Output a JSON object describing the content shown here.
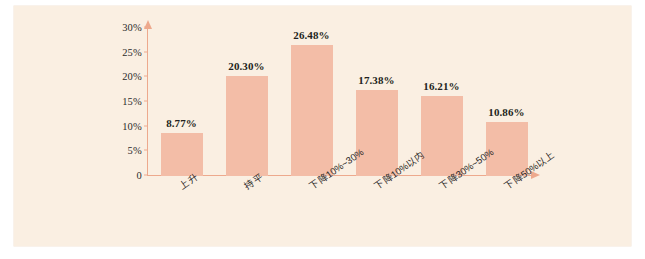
{
  "figure": {
    "background_color": "#faefe2",
    "bar_color": "#f3bda7",
    "axis_color": "#eda98d",
    "text_color": "#231f20"
  },
  "chart_data": {
    "type": "bar",
    "title": "",
    "xlabel": "",
    "ylabel": "",
    "ylim": [
      0,
      30
    ],
    "grid": false,
    "legend": "none",
    "categories": [
      "上升",
      "持平",
      "下降10%~30%",
      "下降10%以内",
      "下降30%~50%",
      "下降50%以上"
    ],
    "values": [
      8.77,
      20.3,
      26.48,
      17.38,
      16.21,
      10.86
    ],
    "data_labels": [
      "8.77%",
      "20.30%",
      "26.48%",
      "17.38%",
      "16.21%",
      "10.86%"
    ],
    "y_ticks": [
      0,
      5,
      10,
      15,
      20,
      25,
      30
    ],
    "y_tick_labels": [
      "0",
      "5%",
      "10%",
      "15%",
      "20%",
      "25%",
      "30%"
    ]
  }
}
